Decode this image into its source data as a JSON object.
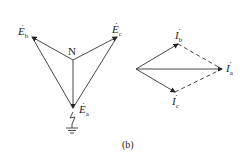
{
  "left_diagram": {
    "neutral_label": "N",
    "labels": {
      "Eb": {
        "main": "E",
        "sub": "b"
      },
      "Ec": {
        "main": "E",
        "sub": "c"
      },
      "Ea": {
        "main": "E",
        "sub": "a"
      }
    },
    "has_ground_fault_symbol": true
  },
  "right_diagram": {
    "labels": {
      "Ib": {
        "main": "I",
        "sub": "b"
      },
      "Ia": {
        "main": "I",
        "sub": "a"
      },
      "Ic": {
        "main": "I",
        "sub": "c"
      }
    }
  },
  "caption": "(b)",
  "colors": {
    "line": "#333333",
    "background": "#ffffff"
  }
}
